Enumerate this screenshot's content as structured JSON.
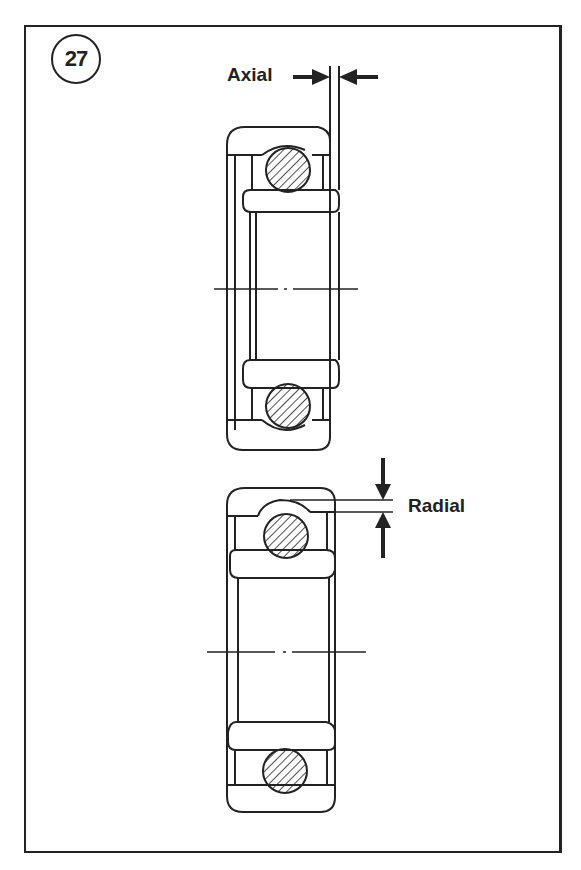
{
  "figure": {
    "number": "27",
    "labels": {
      "axial": "Axial",
      "radial": "Radial"
    },
    "elements": [
      {
        "id": "top-bearing",
        "depicts": "bearing cross-section showing axial clearance (inner ring offset sideways)"
      },
      {
        "id": "bottom-bearing",
        "depicts": "bearing cross-section showing radial clearance (gap above ball)"
      }
    ]
  },
  "colors": {
    "ink": "#222222",
    "background": "#ffffff"
  }
}
